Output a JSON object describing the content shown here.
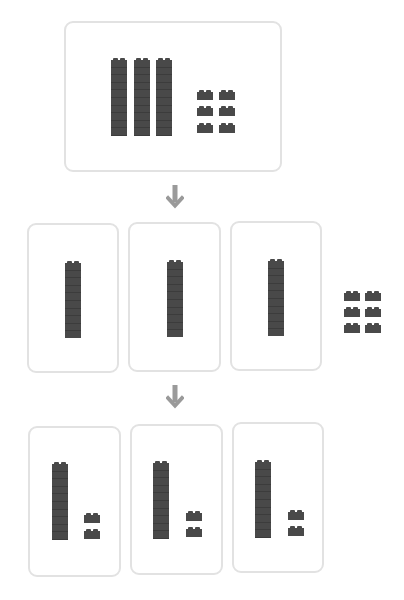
{
  "diagram": {
    "colors": {
      "block": "#494949",
      "card_border": "#e2e2e2",
      "arrow": "#9a9a9a"
    },
    "step1": {
      "label": "whole",
      "tens_rods": 3,
      "unit_cubes": 6
    },
    "step2": {
      "label": "tens distributed",
      "groups": [
        {
          "tens_rods": 1
        },
        {
          "tens_rods": 1
        },
        {
          "tens_rods": 1
        }
      ],
      "leftover_unit_cubes": 6
    },
    "step3": {
      "label": "units distributed",
      "groups": [
        {
          "tens_rods": 1,
          "unit_cubes": 2
        },
        {
          "tens_rods": 1,
          "unit_cubes": 2
        },
        {
          "tens_rods": 1,
          "unit_cubes": 2
        }
      ]
    },
    "arrows": [
      {
        "icon": "arrow-down-icon"
      },
      {
        "icon": "arrow-down-icon"
      }
    ]
  }
}
